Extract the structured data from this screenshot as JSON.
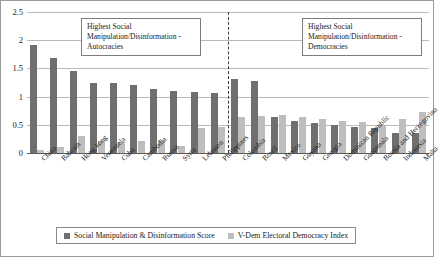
{
  "chart_data": {
    "type": "bar",
    "title": "",
    "xlabel": "",
    "ylabel": "",
    "ylim": [
      0,
      2.5
    ],
    "yticks": [
      "0",
      "0.5",
      "1",
      "1.5",
      "2",
      "2.5"
    ],
    "grid": true,
    "legend_position": "bottom",
    "categories": [
      "China",
      "Bahrain",
      "Hong kong",
      "Venezuela",
      "Cuba",
      "Cambodia",
      "Russia",
      "Syria",
      "Lebanon",
      "Philippines",
      "Colombia",
      "Brazil",
      "Mexico",
      "Guyana",
      "Georgia",
      "Dominican Republic",
      "Guatemala",
      "Bosnia and Herzegovina",
      "Indonesia",
      "Malta"
    ],
    "series": [
      {
        "name": "Social Manipulation & Disinformation Score",
        "color": "#6f6f70",
        "values": [
          1.92,
          1.68,
          1.45,
          1.25,
          1.24,
          1.2,
          1.14,
          1.1,
          1.08,
          1.06,
          1.31,
          1.27,
          0.63,
          0.57,
          0.53,
          0.49,
          0.46,
          0.45,
          0.36,
          0.35
        ]
      },
      {
        "name": "V-Dem Electoral Democracy Index",
        "color": "#bebebe",
        "values": [
          0.06,
          0.1,
          0.3,
          0.21,
          0.19,
          0.22,
          0.23,
          0.12,
          0.45,
          0.47,
          0.64,
          0.65,
          0.68,
          0.64,
          0.61,
          0.57,
          0.55,
          0.5,
          0.6,
          0.72
        ]
      }
    ],
    "annotations": [
      {
        "id": "autocracies",
        "text": "Highest Social Manipulation/Disinformation - Autocracies",
        "applies_to_categories_index_range": [
          0,
          9
        ]
      },
      {
        "id": "democracies",
        "text": "Highest Social Manipulation/Disinformation - Democracies",
        "applies_to_categories_index_range": [
          10,
          19
        ]
      }
    ],
    "divider": {
      "after_category": "Philippines",
      "style": "dashed"
    }
  },
  "legend": {
    "items": [
      {
        "label": "Social Manipulation & Disinformation Score",
        "color": "#6f6f70"
      },
      {
        "label": "V-Dem Electoral Democracy Index",
        "color": "#bebebe"
      }
    ]
  }
}
